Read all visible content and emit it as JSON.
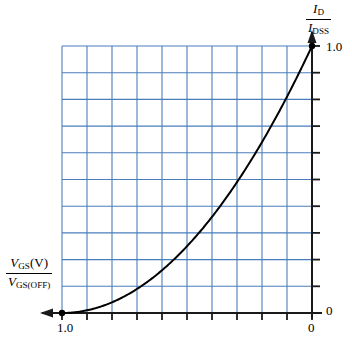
{
  "figure": {
    "name": "jfet-transfer-characteristic-curve",
    "background": "#ffffff"
  },
  "axes": {
    "x": {
      "label_numerator": "V",
      "label_numerator_sub": "GS",
      "label_numerator_suffix": "(V)",
      "label_denominator": "V",
      "label_denominator_sub": "GS(OFF)",
      "tick_left": "1.0",
      "tick_right": "0",
      "divisions": 10,
      "arrow_direction": "left"
    },
    "y": {
      "label_numerator": "I",
      "label_numerator_sub": "D",
      "label_denominator": "I",
      "label_denominator_sub": "DSS",
      "tick_top": "1.0",
      "tick_bottom": "0",
      "divisions": 10,
      "arrow_direction": "up"
    }
  },
  "style": {
    "grid_color": "#4A7EBB",
    "axis_color": "#1a1a1a",
    "curve_color": "#000000",
    "text_color": "#000000",
    "grid_line_width": 1.1,
    "axis_line_width": 2.0,
    "curve_line_width": 2.0
  },
  "chart_data": {
    "type": "line",
    "title": "",
    "xlabel": "VGS(V) / VGS(OFF)",
    "ylabel": "ID / IDSS",
    "xlim": [
      1.0,
      0.0
    ],
    "ylim": [
      0.0,
      1.0
    ],
    "x_tick_labels": [
      "1.0",
      "0"
    ],
    "y_tick_labels": [
      "0",
      "1.0"
    ],
    "x_ticks": [
      1.0,
      0.9,
      0.8,
      0.7,
      0.6,
      0.5,
      0.4,
      0.3,
      0.2,
      0.1,
      0.0
    ],
    "y_ticks": [
      0.0,
      0.1,
      0.2,
      0.3,
      0.4,
      0.5,
      0.6,
      0.7,
      0.8,
      0.9,
      1.0
    ],
    "grid": true,
    "legend": false,
    "x_axis_direction": "reversed",
    "equation": "ID/IDSS = (1 - VGS/VGS(off))^2",
    "series": [
      {
        "name": "ID/IDSS transfer curve",
        "marker_points": [
          {
            "x": 1.0,
            "y": 0.0
          },
          {
            "x": 0.0,
            "y": 1.0
          }
        ],
        "x": [
          1.0,
          0.9,
          0.8,
          0.7,
          0.6,
          0.5,
          0.4,
          0.3,
          0.2,
          0.1,
          0.0
        ],
        "values": [
          0.0,
          0.01,
          0.04,
          0.09,
          0.16,
          0.25,
          0.36,
          0.49,
          0.64,
          0.81,
          1.0
        ]
      }
    ]
  }
}
